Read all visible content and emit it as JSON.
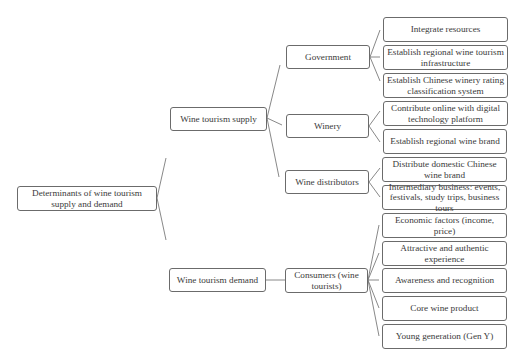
{
  "diagram": {
    "root": {
      "label": "Determinants of wine tourism supply and demand"
    },
    "supply": {
      "label": "Wine tourism supply",
      "actors": [
        {
          "label": "Government",
          "items": [
            "Integrate resources",
            "Establish regional wine tourism infrastructure",
            "Establish Chinese winery rating classification system"
          ]
        },
        {
          "label": "Winery",
          "items": [
            "Contribute online with digital technology platform",
            "Establish regional wine brand"
          ]
        },
        {
          "label": "Wine distributors",
          "items": [
            "Distribute domestic Chinese wine brand",
            "Intermediary business: events, festivals, study trips, business tours"
          ]
        }
      ]
    },
    "demand": {
      "label": "Wine tourism demand",
      "actors": [
        {
          "label": "Consumers (wine tourists)",
          "items": [
            "Economic factors (income, price)",
            "Attractive and authentic experience",
            "Awareness and recognition",
            "Core wine product",
            "Young generation (Gen Y)"
          ]
        }
      ]
    }
  }
}
